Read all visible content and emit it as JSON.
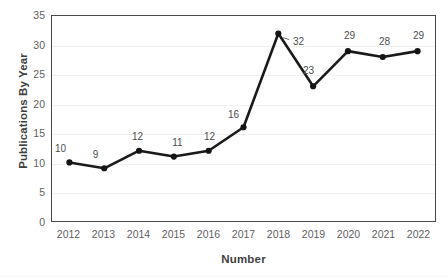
{
  "chart_data": {
    "type": "line",
    "title": "",
    "xlabel": "Number",
    "ylabel": "Publications By Year",
    "categories": [
      "2012",
      "2013",
      "2014",
      "2015",
      "2016",
      "2017",
      "2018",
      "2019",
      "2020",
      "2021",
      "2022"
    ],
    "values": [
      10,
      9,
      12,
      11,
      12,
      16,
      32,
      23,
      29,
      28,
      29
    ],
    "point_labels": [
      "10",
      "9",
      "12",
      "11",
      "12",
      "16",
      "32",
      "23",
      "29",
      "28",
      "29"
    ],
    "label_offsets": [
      {
        "dx": -9,
        "dy": -16
      },
      {
        "dx": -9,
        "dy": -16
      },
      {
        "dx": -2,
        "dy": -16
      },
      {
        "dx": 3,
        "dy": -16
      },
      {
        "dx": 0,
        "dy": -16
      },
      {
        "dx": -11,
        "dy": -14
      },
      {
        "dx": 19,
        "dy": 7
      },
      {
        "dx": -6,
        "dy": -17
      },
      {
        "dx": 0,
        "dy": -16
      },
      {
        "dx": 0,
        "dy": -16
      },
      {
        "dx": -1,
        "dy": -16
      }
    ],
    "ylim": [
      0,
      35
    ],
    "yticks": [
      0,
      5,
      10,
      15,
      20,
      25,
      30,
      35
    ],
    "ytick_labels": [
      "0",
      "5",
      "10",
      "15",
      "20",
      "25",
      "30",
      "35"
    ],
    "grid": "horizontal",
    "legend": "none",
    "series_color": "#1a1a1a",
    "marker": "circle",
    "marker_color": "#141414",
    "gridline_color": "#f1f1f1",
    "plot_border_color": "#4a4a4a",
    "axis_text_color": "#5f5f5f",
    "title_text_color": "#3f3f3f",
    "background_color": "#ffffff"
  }
}
